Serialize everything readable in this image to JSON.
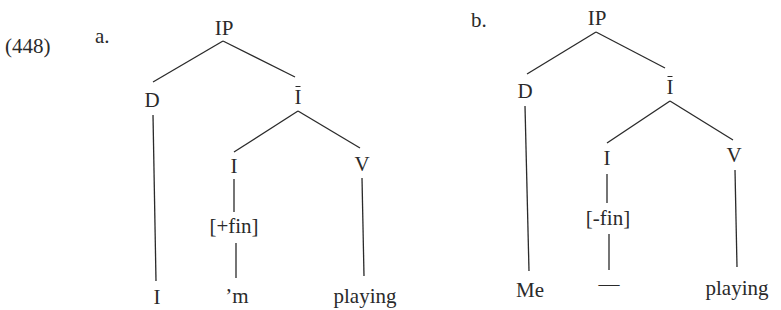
{
  "example_number": "(448)",
  "trees": [
    {
      "label": "a.",
      "nodes": {
        "root": "IP",
        "spec": "D",
        "ibar": "I",
        "head": "I",
        "comp": "V",
        "feature": "[+fin]"
      },
      "leaves": {
        "subject": "I",
        "inflection": "’m",
        "verb": "playing"
      }
    },
    {
      "label": "b.",
      "nodes": {
        "root": "IP",
        "spec": "D",
        "ibar": "I",
        "head": "I",
        "comp": "V",
        "feature": "[-fin]"
      },
      "leaves": {
        "subject": "Me",
        "inflection": "—",
        "verb": "playing"
      }
    }
  ],
  "colors": {
    "ink": "#2a2a2a",
    "background": "#ffffff"
  }
}
